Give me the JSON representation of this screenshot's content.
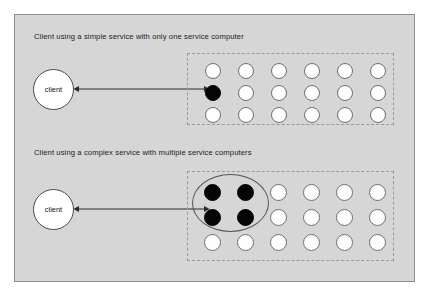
{
  "figure": {
    "background_color": "#d6d6d6",
    "frame_border_color": "#8d8d8d"
  },
  "panels": [
    {
      "id": "simple",
      "caption": "Client using a simple service with only one service computer",
      "client_label": "client",
      "connector": "double-headed-arrow",
      "grid": {
        "columns": 6,
        "rows": 3,
        "filled_count": 1,
        "cells": [
          "empty",
          "empty",
          "empty",
          "empty",
          "empty",
          "empty",
          "filled",
          "empty",
          "empty",
          "empty",
          "empty",
          "empty",
          "empty",
          "empty",
          "empty",
          "empty",
          "empty",
          "empty"
        ]
      },
      "group_ellipse": false
    },
    {
      "id": "complex",
      "caption": "Client using a complex service with multiple service computers",
      "client_label": "client",
      "connector": "double-headed-arrow",
      "grid": {
        "columns": 6,
        "rows": 3,
        "filled_count": 4,
        "cells": [
          "filled",
          "filled",
          "empty",
          "empty",
          "empty",
          "empty",
          "filled",
          "filled",
          "empty",
          "empty",
          "empty",
          "empty",
          "empty",
          "empty",
          "empty",
          "empty",
          "empty",
          "empty"
        ]
      },
      "group_ellipse": true
    }
  ],
  "colors": {
    "node_filled": "#050505",
    "node_empty": "#fdfdfd",
    "node_stroke": "#6f6f6f",
    "arrow": "#2b2b2b",
    "service_box_stroke": "#9a9a9a"
  }
}
